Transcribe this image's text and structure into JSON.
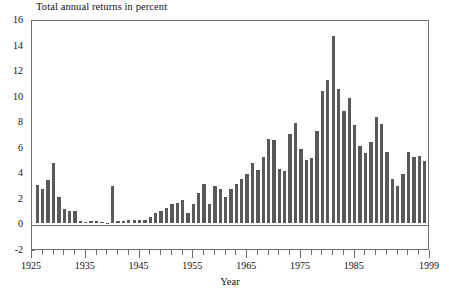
{
  "chart_data": {
    "type": "bar",
    "title": "Total annual returns in percent",
    "xlabel": "Year",
    "ylabel": "",
    "ylim": [
      -2,
      16
    ],
    "xlim": [
      1925,
      1999
    ],
    "grid": false,
    "legend": null,
    "bar_color": "#595959",
    "axis_color": "#6e6e6e",
    "y_ticks": [
      -2,
      0,
      2,
      4,
      6,
      8,
      10,
      12,
      14,
      16
    ],
    "y_tick_labels": [
      "-2",
      "0",
      "2",
      "4",
      "6",
      "8",
      "10",
      "12",
      "14",
      "16"
    ],
    "x_ticks": [
      1925,
      1935,
      1945,
      1955,
      1965,
      1975,
      1985,
      1999
    ],
    "x_tick_labels": [
      "1925",
      "1935",
      "1945",
      "1955",
      "1965",
      "1975",
      "1985",
      "1999"
    ],
    "x_minor_tick_step": 2,
    "categories": [
      1926,
      1927,
      1928,
      1929,
      1930,
      1931,
      1932,
      1933,
      1934,
      1935,
      1936,
      1937,
      1938,
      1939,
      1940,
      1941,
      1942,
      1943,
      1944,
      1945,
      1946,
      1947,
      1948,
      1949,
      1950,
      1951,
      1952,
      1953,
      1954,
      1955,
      1956,
      1957,
      1958,
      1959,
      1960,
      1961,
      1962,
      1963,
      1964,
      1965,
      1966,
      1967,
      1968,
      1969,
      1970,
      1971,
      1972,
      1973,
      1974,
      1975,
      1976,
      1977,
      1978,
      1979,
      1980,
      1981,
      1982,
      1983,
      1984,
      1985,
      1986,
      1987,
      1988,
      1989,
      1990,
      1991,
      1992,
      1993,
      1994,
      1995,
      1996,
      1997,
      1998
    ],
    "values": [
      3.0,
      2.7,
      3.4,
      4.7,
      2.1,
      1.1,
      1.0,
      1.0,
      0.2,
      0.1,
      0.2,
      0.2,
      0.1,
      0.0,
      2.9,
      0.2,
      0.2,
      0.3,
      0.3,
      0.3,
      0.3,
      0.5,
      0.8,
      1.0,
      1.2,
      1.5,
      1.6,
      1.8,
      0.8,
      1.5,
      2.4,
      3.1,
      1.5,
      2.9,
      2.7,
      2.1,
      2.7,
      3.1,
      3.5,
      3.9,
      4.7,
      4.2,
      5.2,
      6.6,
      6.5,
      4.3,
      4.1,
      7.0,
      7.9,
      5.8,
      5.0,
      5.1,
      7.2,
      10.4,
      11.2,
      14.7,
      10.5,
      8.8,
      9.8,
      7.7,
      6.1,
      5.5,
      6.4,
      8.3,
      7.8,
      5.6,
      3.5,
      2.9,
      3.9,
      5.6,
      5.2,
      5.3,
      4.9
    ],
    "annotations": []
  }
}
